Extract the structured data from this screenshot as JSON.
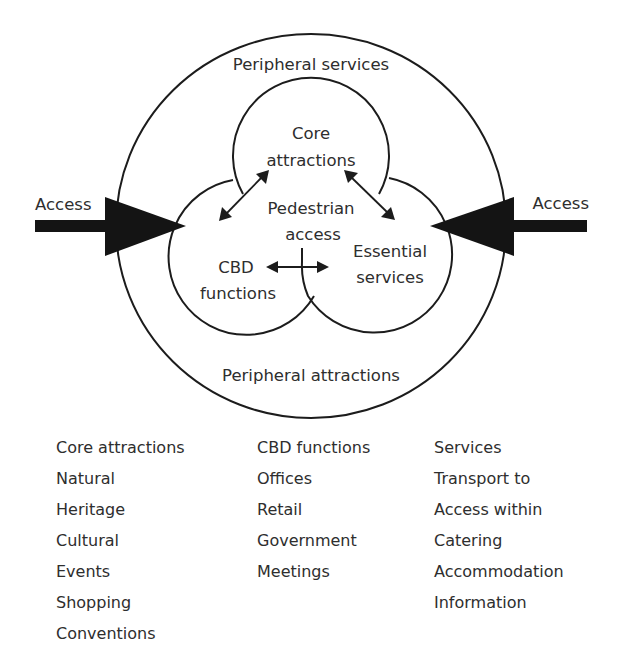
{
  "diagram": {
    "labels": {
      "outer_top": "Peripheral services",
      "outer_bottom": "Peripheral attractions",
      "core_line1": "Core",
      "core_line2": "attractions",
      "center_line1": "Pedestrian",
      "center_line2": "access",
      "cbd_line1": "CBD",
      "cbd_line2": "functions",
      "services_line1": "Essential",
      "services_line2": "services",
      "access_left": "Access",
      "access_right": "Access"
    },
    "shapes": {
      "outer_ring": {
        "cx": 311,
        "cy": 226,
        "rx": 195,
        "ry": 192
      },
      "core_circle": {
        "cx": 311,
        "cy": 158,
        "r": 78
      },
      "cbd_circle": {
        "cx": 248,
        "cy": 255,
        "r": 78
      },
      "services_circle": {
        "cx": 380,
        "cy": 255,
        "r": 78
      }
    },
    "connections": [
      {
        "from": "Core attractions",
        "to": "CBD functions",
        "type": "two-way"
      },
      {
        "from": "Core attractions",
        "to": "Essential services",
        "type": "two-way"
      },
      {
        "from": "CBD functions",
        "to": "Essential services",
        "type": "two-way"
      },
      {
        "from": "Access (left)",
        "to": "CBD functions",
        "type": "one-way"
      },
      {
        "from": "Access (right)",
        "to": "Essential services",
        "type": "one-way"
      }
    ],
    "colors": {
      "stroke": "#1c1c1c",
      "text": "#2e2e2e",
      "background": "#ffffff"
    }
  },
  "legend": {
    "columns": [
      {
        "heading": "Core attractions",
        "items": [
          "Natural",
          "Heritage",
          "Cultural",
          "Events",
          "Shopping",
          "Conventions"
        ]
      },
      {
        "heading": "CBD functions",
        "items": [
          "Offices",
          "Retail",
          "Government",
          "Meetings"
        ]
      },
      {
        "heading": "Services",
        "items": [
          "Transport to",
          "Access within",
          "Catering",
          "Accommodation",
          "Information"
        ]
      }
    ]
  }
}
